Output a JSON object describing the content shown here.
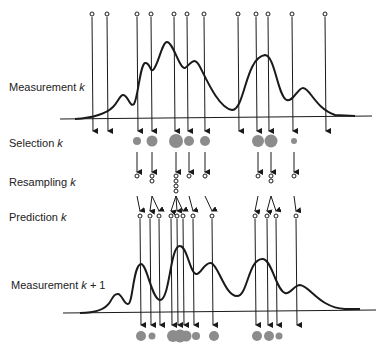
{
  "labels": {
    "measurement_k": {
      "text": "Measurement",
      "var": "k",
      "suffix": ""
    },
    "selection_k": {
      "text": "Selection",
      "var": "k",
      "suffix": ""
    },
    "resampling_k": {
      "text": "Resampling",
      "var": "k",
      "suffix": ""
    },
    "prediction_k": {
      "text": "Prediction",
      "var": "k",
      "suffix": ""
    },
    "measurement_k1": {
      "text": "Measurement",
      "var": "k",
      "suffix": " + 1"
    }
  },
  "colors": {
    "line": "#1a1a1a",
    "dot": "#8c8c8c",
    "text": "#222222"
  },
  "particles_top_x": [
    92,
    107,
    137,
    151,
    174,
    187,
    204,
    238,
    256,
    268,
    292,
    325
  ],
  "selection": [
    {
      "x": 137,
      "r": 4
    },
    {
      "x": 152,
      "r": 5.5
    },
    {
      "x": 176,
      "r": 7
    },
    {
      "x": 189,
      "r": 5
    },
    {
      "x": 205,
      "r": 5
    },
    {
      "x": 258,
      "r": 6
    },
    {
      "x": 271,
      "r": 6.5
    },
    {
      "x": 294,
      "r": 3
    }
  ],
  "resampling_counts": [
    1,
    2,
    4,
    1,
    1,
    1,
    2,
    1
  ],
  "prediction_x": [
    140,
    150,
    159,
    171,
    177,
    183,
    193,
    212,
    255,
    267,
    276,
    296
  ],
  "bottom_dots": [
    {
      "x": 141,
      "r": 5
    },
    {
      "x": 152,
      "r": 3.5
    },
    {
      "x": 173,
      "r": 6
    },
    {
      "x": 180,
      "r": 6.5
    },
    {
      "x": 186,
      "r": 5.5
    },
    {
      "x": 196,
      "r": 4
    },
    {
      "x": 214,
      "r": 5
    },
    {
      "x": 257,
      "r": 5
    },
    {
      "x": 269,
      "r": 5
    },
    {
      "x": 279,
      "r": 3.5
    }
  ]
}
